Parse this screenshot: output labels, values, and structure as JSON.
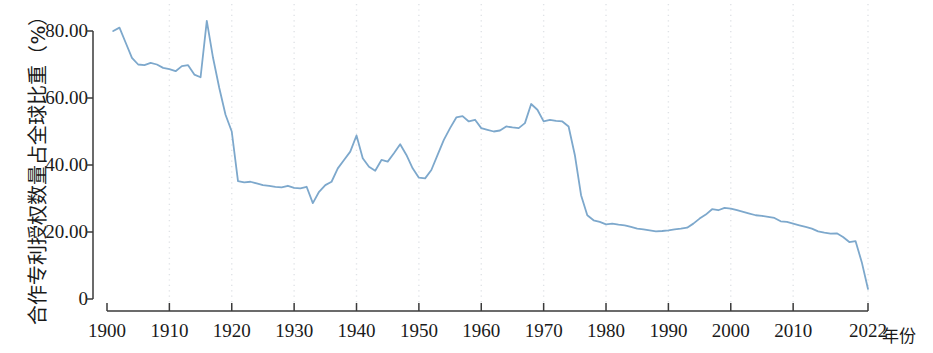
{
  "chart_data": {
    "type": "line",
    "title": "",
    "xlabel": "年份",
    "ylabel": "合作专利授权数量占全球比重（%）",
    "x_unit_label": "年份",
    "xlim": [
      1900,
      2022
    ],
    "ylim": [
      0,
      80
    ],
    "grid": "vertical-dotted",
    "legend": "none",
    "line_color": "#7da8cc",
    "axis_color": "#3a3a3a",
    "grid_color": "#dfe2e6",
    "background": "#ffffff",
    "x_ticks": [
      1900,
      1910,
      1920,
      1930,
      1940,
      1950,
      1960,
      1970,
      1980,
      1990,
      2000,
      2010,
      2022
    ],
    "x_tick_labels": [
      "1900",
      "1910",
      "1920",
      "1930",
      "1940",
      "1950",
      "1960",
      "1970",
      "1980",
      "1990",
      "2000",
      "2010",
      "2022"
    ],
    "y_ticks": [
      0,
      20,
      40,
      60,
      80
    ],
    "y_tick_labels": [
      "0",
      "20.00",
      "40.00",
      "60.00",
      "80.00"
    ],
    "series": [
      {
        "name": "合作专利授权数量占全球比重",
        "x": [
          1901,
          1902,
          1903,
          1904,
          1905,
          1906,
          1907,
          1908,
          1909,
          1910,
          1911,
          1912,
          1913,
          1914,
          1915,
          1916,
          1917,
          1918,
          1919,
          1920,
          1921,
          1922,
          1923,
          1924,
          1925,
          1926,
          1927,
          1928,
          1929,
          1930,
          1931,
          1932,
          1933,
          1934,
          1935,
          1936,
          1937,
          1938,
          1939,
          1940,
          1941,
          1942,
          1943,
          1944,
          1945,
          1946,
          1947,
          1948,
          1949,
          1950,
          1951,
          1952,
          1953,
          1954,
          1955,
          1956,
          1957,
          1958,
          1959,
          1960,
          1961,
          1962,
          1963,
          1964,
          1965,
          1966,
          1967,
          1968,
          1969,
          1970,
          1971,
          1972,
          1973,
          1974,
          1975,
          1976,
          1977,
          1978,
          1979,
          1980,
          1981,
          1982,
          1983,
          1984,
          1985,
          1986,
          1987,
          1988,
          1989,
          1990,
          1991,
          1992,
          1993,
          1994,
          1995,
          1996,
          1997,
          1998,
          1999,
          2000,
          2001,
          2002,
          2003,
          2004,
          2005,
          2006,
          2007,
          2008,
          2009,
          2010,
          2011,
          2012,
          2013,
          2014,
          2015,
          2016,
          2017,
          2018,
          2019,
          2020,
          2021,
          2022
        ],
        "values": [
          80.0,
          81.0,
          76.5,
          72.0,
          70.0,
          69.8,
          70.5,
          70.0,
          69.0,
          68.6,
          68.0,
          69.5,
          69.8,
          67.0,
          66.2,
          83.0,
          72.0,
          63.0,
          55.0,
          50.0,
          35.2,
          34.8,
          35.0,
          34.5,
          34.0,
          33.8,
          33.5,
          33.3,
          33.8,
          33.2,
          33.0,
          33.5,
          28.6,
          32.0,
          34.0,
          35.0,
          39.0,
          41.5,
          44.0,
          48.8,
          42.0,
          39.5,
          38.3,
          41.5,
          41.0,
          43.5,
          46.2,
          43.0,
          39.0,
          36.2,
          36.0,
          38.5,
          43.0,
          47.5,
          51.0,
          54.2,
          54.6,
          53.0,
          53.5,
          51.0,
          50.5,
          50.0,
          50.3,
          51.5,
          51.2,
          51.0,
          52.5,
          58.2,
          56.5,
          53.0,
          53.5,
          53.2,
          53.0,
          51.5,
          43.0,
          31.0,
          25.0,
          23.5,
          23.0,
          22.3,
          22.5,
          22.2,
          22.0,
          21.5,
          21.0,
          20.8,
          20.5,
          20.2,
          20.3,
          20.5,
          20.8,
          21.0,
          21.3,
          22.5,
          24.0,
          25.2,
          26.8,
          26.5,
          27.2,
          27.0,
          26.5,
          26.0,
          25.5,
          25.0,
          24.8,
          24.5,
          24.2,
          23.2,
          23.0,
          22.5,
          22.0,
          21.5,
          21.0,
          20.2,
          19.8,
          19.5,
          19.6,
          18.5,
          17.0,
          17.3,
          11.0,
          3.0
        ]
      }
    ]
  }
}
